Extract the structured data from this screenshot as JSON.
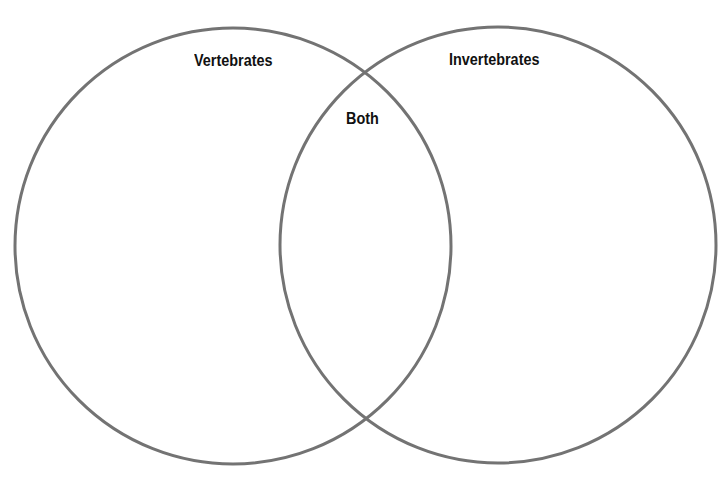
{
  "diagram": {
    "type": "venn",
    "sets": [
      {
        "label": "Vertebrates",
        "cx": 233,
        "cy": 246,
        "r": 218
      },
      {
        "label": "Invertebrates",
        "cx": 498,
        "cy": 245,
        "r": 218
      }
    ],
    "intersection": {
      "label": "Both"
    },
    "stroke_color": "#737373",
    "stroke_width": 3
  }
}
